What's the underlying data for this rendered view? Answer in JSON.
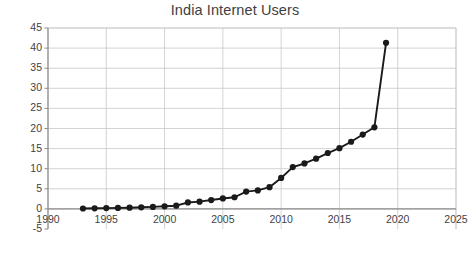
{
  "chart_data": {
    "type": "line",
    "title": "India Internet Users",
    "xlabel": "",
    "ylabel": "",
    "xlim": [
      1990,
      2025
    ],
    "ylim": [
      -5,
      45
    ],
    "grid": true,
    "legend": null,
    "legend_position": "none",
    "xticks": [
      1990,
      1995,
      2000,
      2005,
      2010,
      2015,
      2020,
      2025
    ],
    "yticks": [
      -5,
      0,
      5,
      10,
      15,
      20,
      25,
      30,
      35,
      40,
      45
    ],
    "marker": "filled-circle",
    "line_color": "#1a1a1a",
    "marker_color": "#1a1a1a",
    "grid_color": "#c8c8c8",
    "axis_color": "#8c8c8c",
    "text_color": "#3f3f3f",
    "background": "#ffffff",
    "series": [
      {
        "name": "India Internet Users",
        "x": [
          1993,
          1994,
          1995,
          1996,
          1997,
          1998,
          1999,
          2000,
          2001,
          2002,
          2003,
          2004,
          2005,
          2006,
          2007,
          2008,
          2009,
          2010,
          2011,
          2012,
          2013,
          2014,
          2015,
          2016,
          2017,
          2018,
          2019
        ],
        "values": [
          0.0,
          0.02,
          0.03,
          0.05,
          0.07,
          0.14,
          0.27,
          0.53,
          0.66,
          1.54,
          1.69,
          1.98,
          2.39,
          2.81,
          3.95,
          4.38,
          5.12,
          7.5,
          10.07,
          12.58,
          15.1,
          18.0,
          21.0,
          25.0,
          29.5,
          20.31,
          41.26
        ],
        "plot_values": [
          0.1,
          0.15,
          0.2,
          0.25,
          0.3,
          0.4,
          0.5,
          0.65,
          0.8,
          1.6,
          1.8,
          2.2,
          2.6,
          2.9,
          4.3,
          4.6,
          5.4,
          7.7,
          10.4,
          11.3,
          12.5,
          13.9,
          15.1,
          16.7,
          18.5,
          20.3,
          41.3
        ]
      }
    ],
    "annotations": []
  }
}
